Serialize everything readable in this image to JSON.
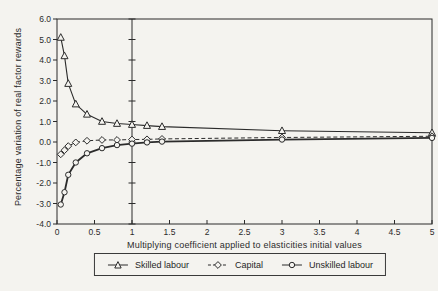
{
  "figure": {
    "paper_color": "#f4f3ef",
    "ink_color": "#2b2b2b"
  },
  "chart_data": {
    "type": "line",
    "title": "",
    "xlabel": "Multiplying coefficient applied to elasticities initial values",
    "ylabel": "Percentage variation of real factor rewards",
    "xlim": [
      0,
      5
    ],
    "ylim": [
      -4,
      6
    ],
    "x_ticks": [
      0,
      0.5,
      1,
      1.5,
      2,
      2.5,
      3,
      3.5,
      4,
      4.5,
      5
    ],
    "x_tick_labels": [
      "0",
      "0.5",
      "1",
      "1.5",
      "2",
      "2.5",
      "3",
      "3.5",
      "4",
      "4.5",
      "5"
    ],
    "y_ticks": [
      -4,
      -3,
      -2,
      -1,
      0,
      1,
      2,
      3,
      4,
      5,
      6
    ],
    "y_tick_labels": [
      "-4.0",
      "-3.0",
      "-2.0",
      "-1.0",
      "0.0",
      "1.0",
      "2.0",
      "3.0",
      "4.0",
      "5.0",
      "6.0"
    ],
    "reference_line_x": 1,
    "grid": false,
    "legend_position": "bottom",
    "x": [
      0.05,
      0.1,
      0.15,
      0.25,
      0.4,
      0.6,
      0.8,
      1.0,
      1.2,
      1.4,
      3.0,
      5.0
    ],
    "series": [
      {
        "name": "Skilled labour",
        "marker": "triangle",
        "line": "solid",
        "line_width": 1.1,
        "values": [
          5.1,
          4.2,
          2.85,
          1.85,
          1.35,
          1.0,
          0.9,
          0.85,
          0.8,
          0.75,
          0.55,
          0.45
        ]
      },
      {
        "name": "Capital",
        "marker": "diamond",
        "line": "dashed",
        "line_width": 1.0,
        "values": [
          -0.6,
          -0.4,
          -0.2,
          -0.02,
          0.06,
          0.1,
          0.1,
          0.12,
          0.13,
          0.15,
          0.22,
          0.28
        ]
      },
      {
        "name": "Unskilled labour",
        "marker": "circle",
        "line": "solid",
        "line_width": 1.8,
        "values": [
          -3.05,
          -2.45,
          -1.6,
          -1.0,
          -0.55,
          -0.3,
          -0.15,
          -0.08,
          -0.02,
          0.02,
          0.12,
          0.2
        ]
      }
    ]
  },
  "legend": {
    "items": [
      {
        "label": "Skilled labour",
        "marker": "triangle",
        "line": "solid"
      },
      {
        "label": "Capital",
        "marker": "diamond",
        "line": "dashed"
      },
      {
        "label": "Unskilled labour",
        "marker": "circle",
        "line": "solid"
      }
    ]
  }
}
